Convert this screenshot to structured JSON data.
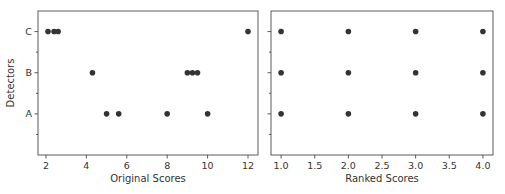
{
  "chart_data": [
    {
      "type": "scatter",
      "title": "",
      "xlabel": "Original Scores",
      "ylabel": "Detectors",
      "xlim": [
        1.605,
        12.495
      ],
      "ylim": [
        -1,
        2.5
      ],
      "xticks": [
        2,
        4,
        6,
        8,
        10,
        12
      ],
      "xtick_labels": [
        "2",
        "4",
        "6",
        "8",
        "10",
        "12"
      ],
      "yticks": [
        0,
        1,
        2
      ],
      "ytick_labels": [
        "A",
        "B",
        "C"
      ],
      "minor_yticks": [
        -0.5,
        0.5,
        1.5
      ],
      "grid": false,
      "series": [
        {
          "name": "A",
          "y": 0,
          "x": [
            5.0,
            5.6,
            8.0,
            10.0
          ]
        },
        {
          "name": "B",
          "y": 1,
          "x": [
            4.3,
            9.0,
            9.25,
            9.5
          ]
        },
        {
          "name": "C",
          "y": 2,
          "x": [
            2.1,
            2.4,
            2.6,
            12.0
          ]
        }
      ]
    },
    {
      "type": "scatter",
      "title": "",
      "xlabel": "Ranked Scores",
      "ylabel": "",
      "xlim": [
        0.85,
        4.15
      ],
      "ylim": [
        -1,
        2.5
      ],
      "xticks": [
        1.0,
        1.5,
        2.0,
        2.5,
        3.0,
        3.5,
        4.0
      ],
      "xtick_labels": [
        "1.0",
        "1.5",
        "2.0",
        "2.5",
        "3.0",
        "3.5",
        "4.0"
      ],
      "yticks": [
        0,
        1,
        2
      ],
      "ytick_labels": [
        "",
        "",
        ""
      ],
      "minor_yticks": [
        -0.5,
        0.5,
        1.5
      ],
      "grid": false,
      "series": [
        {
          "name": "A",
          "y": 0,
          "x": [
            1,
            2,
            3,
            4
          ]
        },
        {
          "name": "B",
          "y": 1,
          "x": [
            1,
            2,
            3,
            4
          ]
        },
        {
          "name": "C",
          "y": 2,
          "x": [
            1,
            2,
            3,
            4
          ]
        }
      ]
    }
  ]
}
